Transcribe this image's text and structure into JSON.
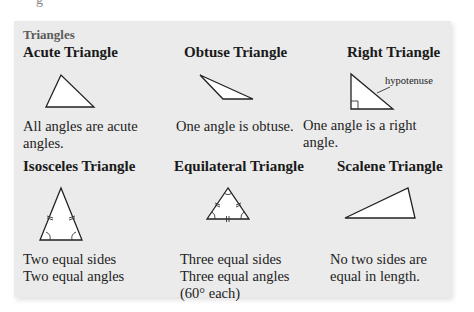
{
  "figure": {
    "title": "Triangles",
    "triangles": [
      {
        "name": "Acute Triangle",
        "description_lines": [
          "All angles are acute",
          "angles."
        ],
        "icon": "acute-triangle-icon"
      },
      {
        "name": "Obtuse Triangle",
        "description_lines": [
          "One angle is obtuse."
        ],
        "icon": "obtuse-triangle-icon"
      },
      {
        "name": "Right Triangle",
        "description_lines": [
          "One angle is a right",
          "angle."
        ],
        "icon": "right-triangle-icon",
        "label": "hypotenuse"
      },
      {
        "name": "Isosceles Triangle",
        "description_lines": [
          "Two equal sides",
          "Two equal angles"
        ],
        "icon": "isosceles-triangle-icon"
      },
      {
        "name": "Equilateral Triangle",
        "description_lines": [
          "Three equal sides",
          "Three equal angles",
          "(60° each)"
        ],
        "icon": "equilateral-triangle-icon"
      },
      {
        "name": "Scalene Triangle",
        "description_lines": [
          "No two sides are",
          "equal in length."
        ],
        "icon": "scalene-triangle-icon"
      }
    ]
  },
  "colors": {
    "panel_background": "#ebebeb",
    "title_color": "#5a5a5a",
    "text_color": "#1a1a1a"
  }
}
